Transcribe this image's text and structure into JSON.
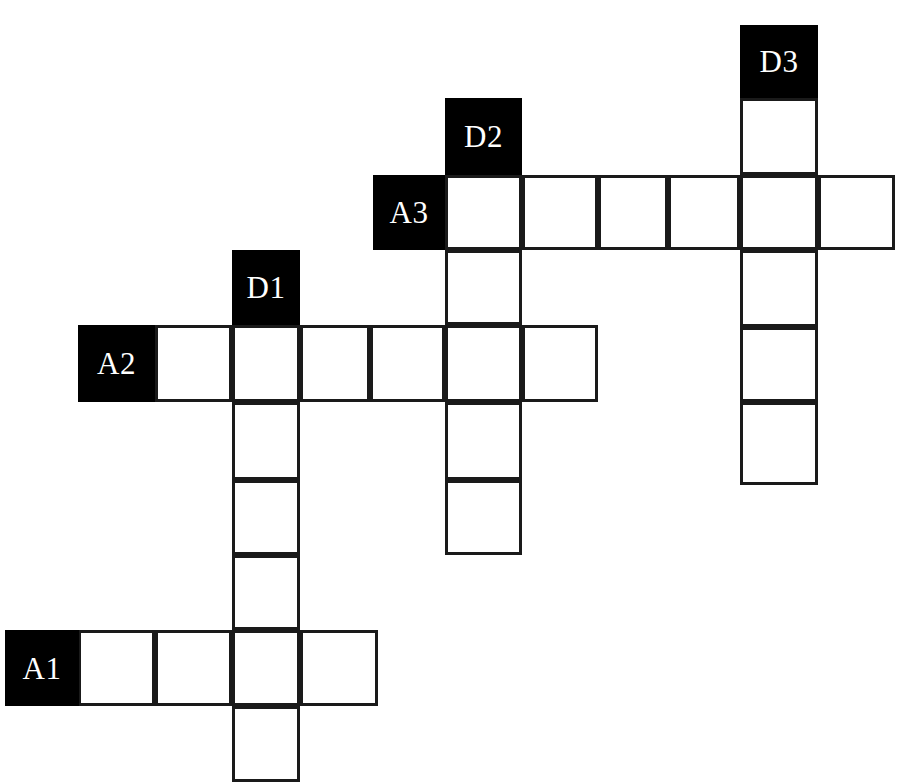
{
  "puzzle": {
    "kind": "crossword-grid",
    "background_color": "#ffffff",
    "cell_fill_color": "#ffffff",
    "grid_line_color": "#1a1a1a",
    "clue_cell_color": "#000000",
    "clue_text_color": "#ffffff",
    "canvas": {
      "width": 901,
      "height": 784
    },
    "cell_size": {
      "width": 74,
      "height": 76
    },
    "across_label_prefix": "A",
    "down_label_prefix": "D",
    "clue_labels": [
      "A1",
      "A2",
      "A3",
      "D1",
      "D2",
      "D3"
    ],
    "entries": [
      {
        "id": "A1",
        "label": "A1",
        "direction": "across",
        "length": 4,
        "label_cell": {
          "x": 5,
          "y": 630,
          "w": 74,
          "h": 76
        },
        "cells": [
          {
            "x": 78,
            "y": 630,
            "w": 77,
            "h": 76,
            "letter": ""
          },
          {
            "x": 155,
            "y": 630,
            "w": 77,
            "h": 76,
            "letter": ""
          },
          {
            "x": 232,
            "y": 630,
            "w": 68,
            "h": 76,
            "letter": ""
          },
          {
            "x": 300,
            "y": 630,
            "w": 78,
            "h": 76,
            "letter": ""
          }
        ]
      },
      {
        "id": "A2",
        "label": "A2",
        "direction": "across",
        "length": 6,
        "label_cell": {
          "x": 78,
          "y": 325,
          "w": 77,
          "h": 77
        },
        "cells": [
          {
            "x": 155,
            "y": 325,
            "w": 77,
            "h": 77,
            "letter": ""
          },
          {
            "x": 232,
            "y": 325,
            "w": 68,
            "h": 77,
            "letter": ""
          },
          {
            "x": 300,
            "y": 325,
            "w": 70,
            "h": 77,
            "letter": ""
          },
          {
            "x": 370,
            "y": 325,
            "w": 75,
            "h": 77,
            "letter": ""
          },
          {
            "x": 445,
            "y": 325,
            "w": 77,
            "h": 77,
            "letter": ""
          },
          {
            "x": 522,
            "y": 325,
            "w": 76,
            "h": 77,
            "letter": ""
          }
        ]
      },
      {
        "id": "A3",
        "label": "A3",
        "direction": "across",
        "length": 6,
        "label_cell": {
          "x": 373,
          "y": 175,
          "w": 72,
          "h": 75
        },
        "cells": [
          {
            "x": 445,
            "y": 175,
            "w": 77,
            "h": 75,
            "letter": ""
          },
          {
            "x": 522,
            "y": 175,
            "w": 76,
            "h": 75,
            "letter": ""
          },
          {
            "x": 598,
            "y": 175,
            "w": 70,
            "h": 75,
            "letter": ""
          },
          {
            "x": 668,
            "y": 175,
            "w": 72,
            "h": 75,
            "letter": ""
          },
          {
            "x": 740,
            "y": 175,
            "w": 78,
            "h": 75,
            "letter": ""
          },
          {
            "x": 818,
            "y": 175,
            "w": 77,
            "h": 75,
            "letter": ""
          }
        ]
      },
      {
        "id": "D1",
        "label": "D1",
        "direction": "down",
        "length": 6,
        "label_cell": {
          "x": 232,
          "y": 250,
          "w": 68,
          "h": 75
        },
        "cells": [
          {
            "x": 232,
            "y": 325,
            "w": 68,
            "h": 77,
            "letter": ""
          },
          {
            "x": 232,
            "y": 402,
            "w": 68,
            "h": 78,
            "letter": ""
          },
          {
            "x": 232,
            "y": 480,
            "w": 68,
            "h": 75,
            "letter": ""
          },
          {
            "x": 232,
            "y": 555,
            "w": 68,
            "h": 75,
            "letter": ""
          },
          {
            "x": 232,
            "y": 630,
            "w": 68,
            "h": 76,
            "letter": ""
          },
          {
            "x": 232,
            "y": 706,
            "w": 68,
            "h": 76,
            "letter": ""
          }
        ]
      },
      {
        "id": "D2",
        "label": "D2",
        "direction": "down",
        "length": 5,
        "label_cell": {
          "x": 445,
          "y": 98,
          "w": 77,
          "h": 77
        },
        "cells": [
          {
            "x": 445,
            "y": 175,
            "w": 77,
            "h": 75,
            "letter": ""
          },
          {
            "x": 445,
            "y": 250,
            "w": 77,
            "h": 75,
            "letter": ""
          },
          {
            "x": 445,
            "y": 325,
            "w": 77,
            "h": 77,
            "letter": ""
          },
          {
            "x": 445,
            "y": 402,
            "w": 77,
            "h": 78,
            "letter": ""
          },
          {
            "x": 445,
            "y": 480,
            "w": 77,
            "h": 75,
            "letter": ""
          }
        ]
      },
      {
        "id": "D3",
        "label": "D3",
        "direction": "down",
        "length": 5,
        "label_cell": {
          "x": 740,
          "y": 25,
          "w": 78,
          "h": 73
        },
        "cells": [
          {
            "x": 740,
            "y": 98,
            "w": 78,
            "h": 77,
            "letter": ""
          },
          {
            "x": 740,
            "y": 175,
            "w": 78,
            "h": 75,
            "letter": ""
          },
          {
            "x": 740,
            "y": 250,
            "w": 78,
            "h": 77,
            "letter": ""
          },
          {
            "x": 740,
            "y": 327,
            "w": 78,
            "h": 75,
            "letter": ""
          },
          {
            "x": 740,
            "y": 402,
            "w": 78,
            "h": 83,
            "letter": ""
          }
        ]
      }
    ]
  }
}
